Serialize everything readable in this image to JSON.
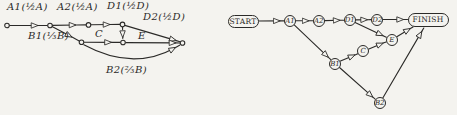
{
  "colors": {
    "ink": "#2b2a28",
    "paper": "#f4f3ef"
  },
  "left_diagram": {
    "labels": {
      "a1": "A1(½A)",
      "a2": "A2(½A)",
      "d1": "D1(½D)",
      "d2": "D2(½D)",
      "b1": "B1(⅓B)",
      "c": "C",
      "e": "E",
      "b2": "B2(⅔B)"
    }
  },
  "right_diagram": {
    "nodes": {
      "start": "START",
      "a1": "A1",
      "a2": "A2",
      "d1": "D1",
      "d2": "D2",
      "finish": "FINISH",
      "e": "E",
      "c": "C",
      "b1": "B1",
      "b2": "B2"
    }
  }
}
